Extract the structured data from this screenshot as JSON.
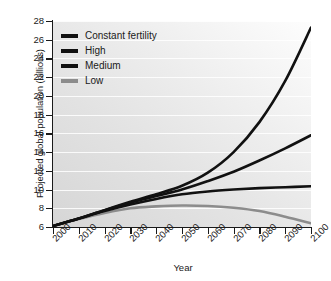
{
  "chart_data": {
    "type": "line",
    "title": "",
    "xlabel": "Year",
    "ylabel": "Projected global population (billions)",
    "xlim": [
      2000,
      2100
    ],
    "ylim": [
      6,
      28
    ],
    "grid": true,
    "legend_position": "top-left",
    "xticks": [
      "2000",
      "2010",
      "2020",
      "2030",
      "2040",
      "2050",
      "2060",
      "2070",
      "2080",
      "2090",
      "2100"
    ],
    "yticks": [
      "6",
      "8",
      "10",
      "12",
      "14",
      "16",
      "18",
      "20",
      "22",
      "24",
      "26",
      "28"
    ],
    "x": [
      2000,
      2010,
      2020,
      2030,
      2040,
      2050,
      2060,
      2070,
      2080,
      2090,
      2100
    ],
    "series": [
      {
        "name": "Constant fertility",
        "color": "#111111",
        "width": 2.6,
        "values": [
          6.1,
          6.9,
          7.8,
          8.7,
          9.5,
          10.4,
          11.8,
          14.0,
          17.2,
          21.6,
          27.3
        ]
      },
      {
        "name": "High",
        "color": "#111111",
        "width": 2.6,
        "values": [
          6.1,
          6.9,
          7.8,
          8.6,
          9.3,
          10.0,
          10.9,
          11.9,
          13.1,
          14.4,
          15.8
        ]
      },
      {
        "name": "Medium",
        "color": "#111111",
        "width": 2.6,
        "values": [
          6.1,
          6.9,
          7.7,
          8.4,
          9.0,
          9.5,
          9.8,
          10.0,
          10.15,
          10.25,
          10.35
        ]
      },
      {
        "name": "Low",
        "color": "#8c8c8c",
        "width": 2.6,
        "values": [
          6.1,
          6.85,
          7.5,
          8.0,
          8.2,
          8.3,
          8.25,
          8.05,
          7.7,
          7.1,
          6.4
        ]
      }
    ]
  },
  "legend": {
    "items": [
      {
        "label": "Constant fertility",
        "color": "#111111"
      },
      {
        "label": "High",
        "color": "#111111"
      },
      {
        "label": "Medium",
        "color": "#111111"
      },
      {
        "label": "Low",
        "color": "#8c8c8c"
      }
    ]
  }
}
